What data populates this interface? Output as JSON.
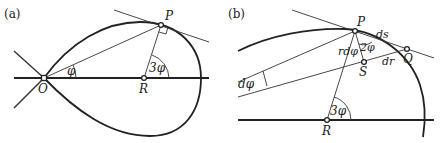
{
  "panels": [
    {
      "id": "a",
      "label": "(a)",
      "points": {
        "O": "O",
        "P": "P",
        "R": "R"
      },
      "angles": {
        "phi": "φ",
        "three_phi": "3φ"
      }
    },
    {
      "id": "b",
      "label": "(b)",
      "points": {
        "P": "P",
        "Q": "Q",
        "S": "S",
        "R": "R"
      },
      "angles": {
        "d_phi": "dφ",
        "two_phi": "2φ",
        "three_phi": "3φ"
      },
      "segments": {
        "ds": "ds",
        "dr": "dr",
        "r_dphi": "rdφ"
      }
    }
  ]
}
